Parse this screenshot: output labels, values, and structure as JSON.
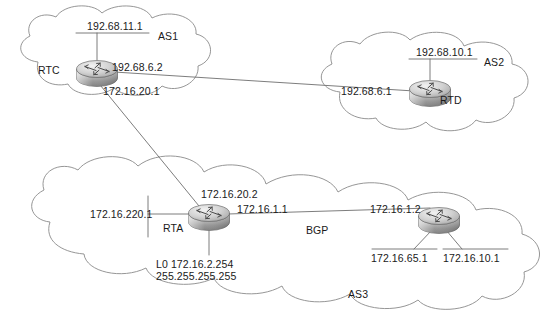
{
  "diagram": {
    "type": "network-topology",
    "background_color": "#ffffff",
    "line_color": "#6e6e6e",
    "text_color": "#1a1a1a"
  },
  "clouds": [
    {
      "id": "as1",
      "label": "AS1"
    },
    {
      "id": "as2",
      "label": "AS2"
    },
    {
      "id": "as3",
      "label": "AS3"
    }
  ],
  "routers": [
    {
      "id": "rtc",
      "name": "RTC"
    },
    {
      "id": "rtd",
      "name": "RTD"
    },
    {
      "id": "rta",
      "name": "RTA"
    },
    {
      "id": "rtb",
      "name": "RTB"
    }
  ],
  "labels": {
    "as1_name": "AS1",
    "as2_name": "AS2",
    "as3_name": "AS3",
    "rtc_name": "RTC",
    "rtd_name": "RTD",
    "rta_name": "RTA",
    "rtc_lan": "192.68.11.1",
    "rtc_to_rtd": "192.68.6.2",
    "rtc_to_rta": "172.16.20.1",
    "rtd_lan": "192.68.10.1",
    "rtd_to_rtc": "192.68.6.1",
    "rta_to_rtc": "172.16.20.2",
    "rta_to_rtb": "172.16.1.1",
    "rta_lan": "172.16.220.1",
    "rta_loopback_line1": "L0 172.16.2.254",
    "rta_loopback_line2": "255.255.255.255",
    "bgp_link": "BGP",
    "rtb_to_rta": "172.16.1.2",
    "rtb_lan1": "172.16.65.1",
    "rtb_lan2": "172.16.10.1"
  }
}
